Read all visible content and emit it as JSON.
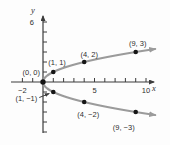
{
  "chart_data": {
    "type": "scatter",
    "title": "",
    "xlabel": "x",
    "ylabel": "y",
    "relation_shown": "x = y^2 (y = ±√x), horizontal parabola opening right, arrows on both branch ends",
    "x_axis": {
      "min": -2,
      "max": 10,
      "tick_step": 1,
      "labeled_ticks": [
        {
          "v": -2,
          "t": "−2"
        },
        {
          "v": 5,
          "t": "5"
        },
        {
          "v": 10,
          "t": "10"
        }
      ]
    },
    "y_axis": {
      "min": -5,
      "max": 6,
      "tick_step": 1,
      "labeled_ticks": [
        {
          "v": 6,
          "t": "6"
        }
      ]
    },
    "curve": {
      "y_from": -3.3,
      "y_to": 3.3,
      "arrows": "both-ends"
    },
    "points": [
      {
        "x": 0,
        "y": 0,
        "label": "(0, 0)",
        "anchor": "end",
        "dx": -3,
        "dy": -7,
        "r": 2.7
      },
      {
        "x": 1,
        "y": 1,
        "label": "(1, 1)",
        "anchor": "start",
        "dx": -5,
        "dy": -7,
        "r": 2.3
      },
      {
        "x": 4,
        "y": 2,
        "label": "(4, 2)",
        "anchor": "middle",
        "dx": 5,
        "dy": -5,
        "r": 2.3
      },
      {
        "x": 9,
        "y": 3,
        "label": "(9, 3)",
        "anchor": "middle",
        "dx": 2,
        "dy": -6,
        "r": 2.3
      },
      {
        "x": 1,
        "y": -1,
        "label": "(1, −1)",
        "anchor": "end",
        "dx": -16,
        "dy": 9,
        "r": 2.3,
        "leader": true
      },
      {
        "x": 4,
        "y": -2,
        "label": "(4, −2)",
        "anchor": "middle",
        "dx": 4,
        "dy": 15,
        "r": 2.3
      },
      {
        "x": 9,
        "y": -3,
        "label": "(9, −3)",
        "anchor": "middle",
        "dx": -12,
        "dy": 18,
        "r": 2.3
      }
    ],
    "colors": {
      "background": "#fdfdfd",
      "axis": "#3c3c3c",
      "curve": "#9b9b9b",
      "point": "#151515",
      "text": "#2e2e2e"
    }
  }
}
